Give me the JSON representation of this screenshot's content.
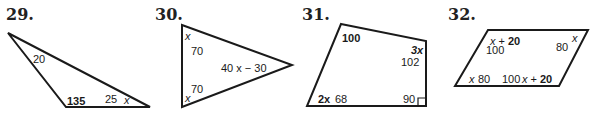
{
  "problems": [
    {
      "number": "29.",
      "shape": "triangle",
      "labels": {
        "top": "20",
        "bottom_left": "135",
        "bottom_right_value": "25",
        "bottom_right_var": "x"
      }
    },
    {
      "number": "30.",
      "shape": "triangle",
      "labels": {
        "top_var": "x",
        "top_value": "70",
        "right": "40 x − 30",
        "bottom_value": "70",
        "bottom_var": "x"
      }
    },
    {
      "number": "31.",
      "shape": "quadrilateral",
      "labels": {
        "top_left": "100",
        "top_right_var": "3x",
        "top_right_value": "102",
        "bottom_left_var": "2x",
        "bottom_left_value": "68",
        "bottom_right": "90"
      }
    },
    {
      "number": "32.",
      "shape": "parallelogram",
      "labels": {
        "top_left_expr": "x + 20",
        "top_left_value": "100",
        "top_right_value": "80",
        "top_right_var": "x",
        "bottom_left_var": "x",
        "bottom_left_value": "80",
        "bottom_right_value": "100",
        "bottom_right_expr": "x + 20"
      }
    }
  ]
}
